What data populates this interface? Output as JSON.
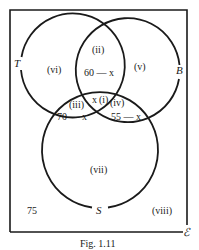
{
  "figure": {
    "caption": "Fig. 1.11",
    "universal_set_label": "ℰ",
    "outside_value": "75"
  },
  "sets": {
    "T": {
      "label": "T"
    },
    "B": {
      "label": "B"
    },
    "S": {
      "label": "S"
    }
  },
  "regions": {
    "i": {
      "label": "(i)",
      "value": "x"
    },
    "ii": {
      "label": "(ii)",
      "value": "60 — x"
    },
    "iii": {
      "label": "(iii)",
      "value": "70 — x"
    },
    "iv": {
      "label": "(iv)",
      "value": "55 — x"
    },
    "v": {
      "label": "(v)"
    },
    "vi": {
      "label": "(vi)"
    },
    "vii": {
      "label": "(vii)"
    },
    "viii": {
      "label": "(viii)"
    }
  },
  "colors": {
    "ink": "#1a1a1a",
    "background": "#ffffff"
  }
}
